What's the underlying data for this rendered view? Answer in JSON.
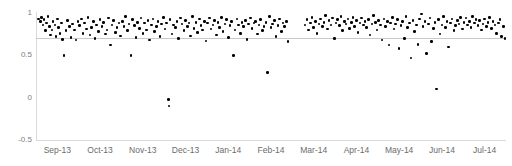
{
  "chart_data": {
    "type": "scatter",
    "title": "",
    "xlabel": "",
    "ylabel": "",
    "ylim": [
      -0.5,
      1
    ],
    "xlim": [
      0,
      11
    ],
    "yticks": [
      "-0.5",
      "0",
      "0.5",
      "1"
    ],
    "ytick_values": [
      -0.5,
      0,
      0.5,
      1
    ],
    "grid": true,
    "gridline_values": [
      0.71
    ],
    "legend": "none",
    "xtick_labels": [
      "Sep-13",
      "Oct-13",
      "Nov-13",
      "Dec-13",
      "Jan-14",
      "Feb-14",
      "Mar-14",
      "Apr-14",
      "May-14",
      "Jun-14",
      "Jul-14"
    ],
    "marker_color": "#000000",
    "series": [
      {
        "name": "series-1",
        "points": [
          [
            0.06,
            0.93
          ],
          [
            0.1,
            0.9
          ],
          [
            0.13,
            0.95
          ],
          [
            0.16,
            0.86
          ],
          [
            0.19,
            0.92
          ],
          [
            0.22,
            0.79
          ],
          [
            0.25,
            0.88
          ],
          [
            0.28,
            0.96
          ],
          [
            0.31,
            0.84
          ],
          [
            0.34,
            0.74
          ],
          [
            0.37,
            0.8
          ],
          [
            0.4,
            0.9
          ],
          [
            0.44,
            0.86
          ],
          [
            0.47,
            0.72
          ],
          [
            0.5,
            0.93
          ],
          [
            0.53,
            0.83
          ],
          [
            0.56,
            0.76
          ],
          [
            0.59,
            0.88
          ],
          [
            0.62,
            0.69
          ],
          [
            0.66,
            0.5
          ],
          [
            0.7,
            0.79
          ],
          [
            0.74,
            0.91
          ],
          [
            0.78,
            0.84
          ],
          [
            0.82,
            0.71
          ],
          [
            0.86,
            0.87
          ],
          [
            0.9,
            0.8
          ],
          [
            0.94,
            0.68
          ],
          [
            0.98,
            0.9
          ],
          [
            1.02,
            0.85
          ],
          [
            1.06,
            0.93
          ],
          [
            1.1,
            0.76
          ],
          [
            1.14,
            0.88
          ],
          [
            1.18,
            0.81
          ],
          [
            1.22,
            0.95
          ],
          [
            1.26,
            0.74
          ],
          [
            1.3,
            0.83
          ],
          [
            1.34,
            0.9
          ],
          [
            1.38,
            0.7
          ],
          [
            1.42,
            0.86
          ],
          [
            1.46,
            0.78
          ],
          [
            1.5,
            0.92
          ],
          [
            1.54,
            0.84
          ],
          [
            1.58,
            0.89
          ],
          [
            1.62,
            0.75
          ],
          [
            1.66,
            0.8
          ],
          [
            1.7,
            0.94
          ],
          [
            1.74,
            0.62
          ],
          [
            1.78,
            0.86
          ],
          [
            1.82,
            0.91
          ],
          [
            1.86,
            0.77
          ],
          [
            1.9,
            0.83
          ],
          [
            1.94,
            0.88
          ],
          [
            1.98,
            0.73
          ],
          [
            2.02,
            0.9
          ],
          [
            2.06,
            0.84
          ],
          [
            2.1,
            0.96
          ],
          [
            2.14,
            0.79
          ],
          [
            2.18,
            0.87
          ],
          [
            2.22,
            0.5
          ],
          [
            2.26,
            0.92
          ],
          [
            2.3,
            0.85
          ],
          [
            2.34,
            0.71
          ],
          [
            2.38,
            0.89
          ],
          [
            2.42,
            0.82
          ],
          [
            2.46,
            0.94
          ],
          [
            2.5,
            0.76
          ],
          [
            2.54,
            0.88
          ],
          [
            2.58,
            0.8
          ],
          [
            2.62,
            0.91
          ],
          [
            2.66,
            0.68
          ],
          [
            2.7,
            0.86
          ],
          [
            2.74,
            0.93
          ],
          [
            2.78,
            0.78
          ],
          [
            2.82,
            0.84
          ],
          [
            2.86,
            0.9
          ],
          [
            2.9,
            0.72
          ],
          [
            2.94,
            0.87
          ],
          [
            2.98,
            0.95
          ],
          [
            3.02,
            0.81
          ],
          [
            3.06,
            0.88
          ],
          [
            3.1,
            -0.02
          ],
          [
            3.11,
            -0.1
          ],
          [
            3.14,
            0.92
          ],
          [
            3.18,
            0.75
          ],
          [
            3.22,
            0.86
          ],
          [
            3.26,
            0.83
          ],
          [
            3.3,
            0.9
          ],
          [
            3.34,
            0.7
          ],
          [
            3.38,
            0.94
          ],
          [
            3.42,
            0.87
          ],
          [
            3.46,
            0.79
          ],
          [
            3.5,
            0.91
          ],
          [
            3.54,
            0.84
          ],
          [
            3.58,
            0.88
          ],
          [
            3.62,
            0.73
          ],
          [
            3.66,
            0.96
          ],
          [
            3.7,
            0.82
          ],
          [
            3.74,
            0.89
          ],
          [
            3.78,
            0.77
          ],
          [
            3.82,
            0.93
          ],
          [
            3.86,
            0.85
          ],
          [
            3.9,
            0.8
          ],
          [
            3.94,
            0.9
          ],
          [
            3.98,
            0.67
          ],
          [
            4.02,
            0.88
          ],
          [
            4.06,
            0.94
          ],
          [
            4.1,
            0.81
          ],
          [
            4.14,
            0.86
          ],
          [
            4.18,
            0.91
          ],
          [
            4.22,
            0.74
          ],
          [
            4.26,
            0.89
          ],
          [
            4.3,
            0.83
          ],
          [
            4.34,
            0.95
          ],
          [
            4.38,
            0.78
          ],
          [
            4.42,
            0.87
          ],
          [
            4.46,
            0.92
          ],
          [
            4.5,
            0.71
          ],
          [
            4.54,
            0.85
          ],
          [
            4.58,
            0.9
          ],
          [
            4.62,
            0.5
          ],
          [
            4.66,
            0.8
          ],
          [
            4.7,
            0.93
          ],
          [
            4.74,
            0.86
          ],
          [
            4.78,
            0.76
          ],
          [
            4.82,
            0.89
          ],
          [
            4.86,
            0.84
          ],
          [
            4.9,
            0.91
          ],
          [
            4.94,
            0.69
          ],
          [
            4.98,
            0.87
          ],
          [
            5.02,
            0.94
          ],
          [
            5.06,
            0.82
          ],
          [
            5.1,
            0.88
          ],
          [
            5.14,
            0.9
          ],
          [
            5.18,
            0.75
          ],
          [
            5.22,
            0.86
          ],
          [
            5.26,
            0.92
          ],
          [
            5.3,
            0.79
          ],
          [
            5.34,
            0.84
          ],
          [
            5.38,
            0.89
          ],
          [
            5.42,
            0.3
          ],
          [
            5.46,
            0.96
          ],
          [
            5.5,
            0.83
          ],
          [
            5.54,
            0.87
          ],
          [
            5.58,
            0.91
          ],
          [
            5.62,
            0.72
          ],
          [
            5.66,
            0.85
          ],
          [
            5.7,
            0.93
          ],
          [
            5.74,
            0.78
          ],
          [
            5.78,
            0.88
          ],
          [
            5.82,
            0.84
          ],
          [
            5.86,
            0.9
          ],
          [
            5.9,
            0.66
          ],
          [
            6.3,
            0.86
          ],
          [
            6.34,
            0.92
          ],
          [
            6.38,
            0.8
          ],
          [
            6.42,
            0.88
          ],
          [
            6.46,
            0.95
          ],
          [
            6.5,
            0.83
          ],
          [
            6.54,
            0.9
          ],
          [
            6.58,
            0.76
          ],
          [
            6.62,
            0.87
          ],
          [
            6.66,
            0.93
          ],
          [
            6.7,
            0.84
          ],
          [
            6.74,
            0.89
          ],
          [
            6.78,
            0.97
          ],
          [
            6.82,
            0.81
          ],
          [
            6.86,
            0.91
          ],
          [
            6.9,
            0.86
          ],
          [
            6.94,
            0.94
          ],
          [
            6.98,
            0.7
          ],
          [
            7.02,
            0.88
          ],
          [
            7.06,
            0.92
          ],
          [
            7.1,
            0.85
          ],
          [
            7.14,
            0.96
          ],
          [
            7.18,
            0.79
          ],
          [
            7.22,
            0.9
          ],
          [
            7.26,
            0.87
          ],
          [
            7.3,
            0.93
          ],
          [
            7.34,
            0.82
          ],
          [
            7.38,
            0.89
          ],
          [
            7.42,
            0.95
          ],
          [
            7.46,
            0.84
          ],
          [
            7.5,
            0.91
          ],
          [
            7.54,
            0.77
          ],
          [
            7.58,
            0.88
          ],
          [
            7.62,
            0.94
          ],
          [
            7.66,
            0.86
          ],
          [
            7.7,
            0.9
          ],
          [
            7.74,
            0.83
          ],
          [
            7.78,
            0.92
          ],
          [
            7.82,
            0.74
          ],
          [
            7.86,
            0.87
          ],
          [
            7.9,
            0.97
          ],
          [
            7.94,
            0.89
          ],
          [
            7.98,
            0.8
          ],
          [
            8.02,
            0.91
          ],
          [
            8.06,
            0.86
          ],
          [
            8.1,
            0.68
          ],
          [
            8.14,
            0.93
          ],
          [
            8.18,
            0.84
          ],
          [
            8.22,
            0.9
          ],
          [
            8.26,
            0.62
          ],
          [
            8.3,
            0.88
          ],
          [
            8.34,
            0.95
          ],
          [
            8.38,
            0.81
          ],
          [
            8.42,
            0.87
          ],
          [
            8.46,
            0.92
          ],
          [
            8.5,
            0.58
          ],
          [
            8.54,
            0.85
          ],
          [
            8.58,
            0.9
          ],
          [
            8.62,
            0.7
          ],
          [
            8.66,
            0.96
          ],
          [
            8.7,
            0.83
          ],
          [
            8.74,
            0.88
          ],
          [
            8.78,
            0.47
          ],
          [
            8.82,
            0.91
          ],
          [
            8.86,
            0.78
          ],
          [
            8.9,
            0.86
          ],
          [
            8.94,
            0.63
          ],
          [
            8.98,
            0.93
          ],
          [
            9.02,
            0.99
          ],
          [
            9.06,
            0.84
          ],
          [
            9.1,
            0.9
          ],
          [
            9.14,
            0.52
          ],
          [
            9.18,
            0.87
          ],
          [
            9.22,
            0.94
          ],
          [
            9.26,
            0.66
          ],
          [
            9.3,
            0.82
          ],
          [
            9.34,
            0.89
          ],
          [
            9.38,
            0.1
          ],
          [
            9.42,
            0.92
          ],
          [
            9.46,
            0.75
          ],
          [
            9.5,
            0.86
          ],
          [
            9.54,
            0.96
          ],
          [
            9.58,
            0.83
          ],
          [
            9.62,
            0.9
          ],
          [
            9.66,
            0.6
          ],
          [
            9.7,
            0.88
          ],
          [
            9.74,
            0.93
          ],
          [
            9.78,
            0.79
          ],
          [
            9.82,
            0.85
          ],
          [
            9.86,
            0.91
          ],
          [
            9.9,
            0.87
          ],
          [
            9.94,
            0.95
          ],
          [
            9.98,
            0.81
          ],
          [
            10.02,
            0.89
          ],
          [
            10.06,
            0.94
          ],
          [
            10.1,
            0.86
          ],
          [
            10.14,
            0.9
          ],
          [
            10.18,
            0.83
          ],
          [
            10.22,
            0.96
          ],
          [
            10.26,
            0.88
          ],
          [
            10.3,
            0.92
          ],
          [
            10.34,
            0.85
          ],
          [
            10.38,
            0.91
          ],
          [
            10.42,
            0.8
          ],
          [
            10.46,
            0.87
          ],
          [
            10.5,
            0.93
          ],
          [
            10.54,
            0.84
          ],
          [
            10.58,
            0.89
          ],
          [
            10.62,
            0.95
          ],
          [
            10.66,
            0.82
          ],
          [
            10.7,
            0.9
          ],
          [
            10.74,
            0.86
          ],
          [
            10.78,
            0.76
          ],
          [
            10.82,
            0.88
          ],
          [
            10.86,
            0.92
          ],
          [
            10.9,
            0.72
          ],
          [
            10.94,
            0.84
          ],
          [
            10.98,
            0.7
          ]
        ]
      }
    ]
  }
}
